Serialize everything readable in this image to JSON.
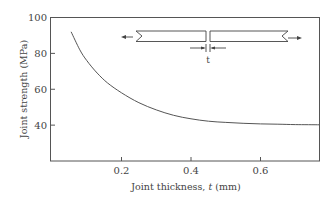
{
  "chart_data": {
    "type": "line",
    "title": "",
    "xlabel": "Joint thickness, t (mm)",
    "ylabel": "Joint strength (MPa)",
    "xlim": [
      0,
      0.78
    ],
    "ylim": [
      20,
      100
    ],
    "xticks": [
      0.2,
      0.4,
      0.6
    ],
    "xtick_labels": [
      "0.2",
      "0.4",
      "0.6"
    ],
    "yticks": [
      40,
      60,
      80,
      100
    ],
    "ytick_labels": [
      "40",
      "60",
      "80",
      "100"
    ],
    "grid": false,
    "legend": null,
    "series": [
      {
        "name": "Joint strength",
        "x": [
          0.055,
          0.08,
          0.1,
          0.13,
          0.16,
          0.2,
          0.25,
          0.3,
          0.35,
          0.4,
          0.45,
          0.5,
          0.55,
          0.6,
          0.65,
          0.7,
          0.77
        ],
        "y": [
          92,
          82,
          76,
          69,
          63.5,
          58,
          52.5,
          48.5,
          45.5,
          43.5,
          42.2,
          41.5,
          41,
          40.7,
          40.5,
          40.3,
          40.2
        ]
      }
    ],
    "annotations": [
      {
        "type": "inset-diagram",
        "description": "Butt joint loaded in tension with arrows on both ends; joint thickness marked t",
        "label": "t"
      }
    ]
  },
  "axes": {
    "xlabel_main": "Joint thickness, ",
    "xlabel_var": "t",
    "xlabel_unit": " (mm)",
    "ylabel": "Joint strength (MPa)"
  },
  "inset": {
    "thickness_label": "t"
  }
}
